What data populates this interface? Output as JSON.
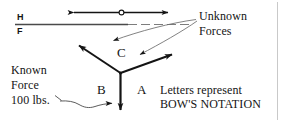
{
  "figure": {
    "title_alt": "Bow's notation force diagram",
    "ink_color": "#141414",
    "thin_line_color": "#6b6b6b",
    "border_color": "#c9c9c9",
    "background": "#ffffff"
  },
  "projection_line": {
    "upper_label": "H",
    "lower_label": "F",
    "description": "horizontal fold line separating horizontal and frontal views"
  },
  "top_vector": {
    "label": "",
    "style": "double-headed arrow with open circle at midpoint"
  },
  "annotations": {
    "unknown_forces_line1": "Unknown",
    "unknown_forces_line2": "Forces",
    "known_line1": "Known",
    "known_line2": "Force",
    "known_line3": "100 lbs.",
    "note_line1": "Letters represent",
    "note_line2": "BOW'S NOTATION"
  },
  "bow_letters": {
    "a": "A",
    "b": "B",
    "c": "C"
  },
  "icons": {
    "arrowhead": "arrowhead-icon",
    "pivot_circle": "pivot-circle-icon",
    "leader_line": "leader-line-icon"
  }
}
